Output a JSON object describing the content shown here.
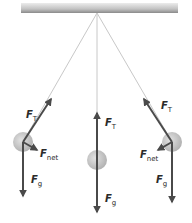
{
  "diagram": {
    "colors": {
      "ceiling_light": "#e4e4e4",
      "ceiling_dark": "#8a8a8a",
      "string": "#c8c8c8",
      "arrow": "#4a4a4a",
      "bob_outer": "#cfcfcf",
      "bob_inner": "#b5b5b5"
    },
    "labels": {
      "tension": {
        "symbol": "F",
        "subscript": "T"
      },
      "net": {
        "symbol": "F",
        "subscript": "net"
      },
      "gravity": {
        "symbol": "F",
        "subscript": "g"
      }
    },
    "positions": [
      {
        "name": "left",
        "has_net": true
      },
      {
        "name": "center",
        "has_net": false
      },
      {
        "name": "right",
        "has_net": true
      }
    ]
  }
}
